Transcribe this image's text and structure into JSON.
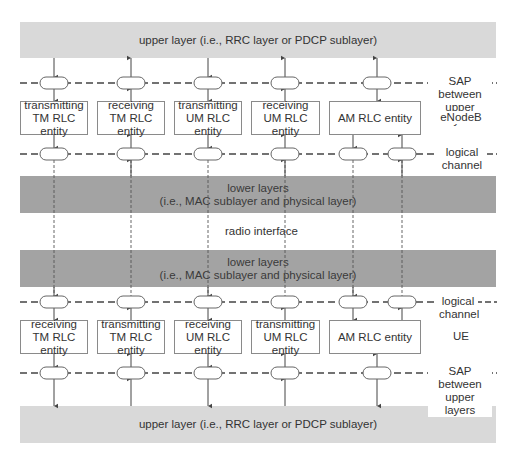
{
  "colors": {
    "upper_bar": "#d9d9d9",
    "lower_bar": "#a3a3a3",
    "line": "#444444",
    "box_border": "#8a8a8a"
  },
  "bars": {
    "top_upper": "upper layer (i.e., RRC layer or PDCP sublayer)",
    "enb_lower_line1": "lower layers",
    "enb_lower_line2": "(i.e., MAC sublayer and physical layer)",
    "radio_interface": "radio interface",
    "ue_lower_line1": "lower layers",
    "ue_lower_line2": "(i.e., MAC sublayer and physical layer)",
    "bottom_upper": "upper layer (i.e., RRC layer or PDCP sublayer)"
  },
  "enodeb": {
    "label": "eNodeB",
    "entities": [
      {
        "text": "transmitting\nTM RLC entity"
      },
      {
        "text": "receiving\nTM RLC entity"
      },
      {
        "text": "transmitting\nUM RLC entity"
      },
      {
        "text": "receiving\nUM RLC entity"
      },
      {
        "text": "AM RLC entity"
      }
    ],
    "sap_label": "SAP between\nupper layers",
    "logical_label": "logical\nchannel"
  },
  "ue": {
    "label": "UE",
    "entities": [
      {
        "text": "receiving\nTM RLC entity"
      },
      {
        "text": "transmitting\nTM RLC entity"
      },
      {
        "text": "receiving\nUM RLC entity"
      },
      {
        "text": "transmitting\nUM RLC entity"
      },
      {
        "text": "AM RLC entity"
      }
    ],
    "sap_label": "SAP between\nupper layers",
    "logical_label": "logical\nchannel"
  }
}
